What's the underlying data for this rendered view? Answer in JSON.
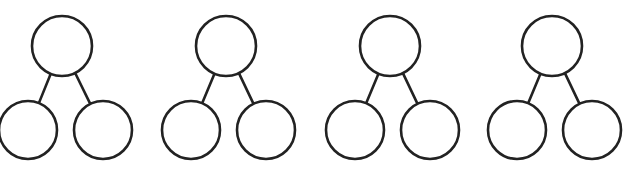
{
  "diagram": {
    "type": "number-bond",
    "stroke_color": "#222222",
    "background": "#ffffff",
    "bonds": [
      {
        "top": {
          "cx": 62,
          "cy": 46,
          "r": 30,
          "label": ""
        },
        "left": {
          "cx": 28,
          "cy": 130,
          "r": 29,
          "label": ""
        },
        "right": {
          "cx": 103,
          "cy": 130,
          "r": 29,
          "label": ""
        }
      },
      {
        "top": {
          "cx": 226,
          "cy": 46,
          "r": 30,
          "label": ""
        },
        "left": {
          "cx": 191,
          "cy": 130,
          "r": 29,
          "label": ""
        },
        "right": {
          "cx": 266,
          "cy": 130,
          "r": 29,
          "label": ""
        }
      },
      {
        "top": {
          "cx": 390,
          "cy": 46,
          "r": 30,
          "label": ""
        },
        "left": {
          "cx": 355,
          "cy": 130,
          "r": 29,
          "label": ""
        },
        "right": {
          "cx": 430,
          "cy": 130,
          "r": 29,
          "label": ""
        }
      },
      {
        "top": {
          "cx": 552,
          "cy": 46,
          "r": 30,
          "label": ""
        },
        "left": {
          "cx": 517,
          "cy": 130,
          "r": 29,
          "label": ""
        },
        "right": {
          "cx": 592,
          "cy": 130,
          "r": 29,
          "label": ""
        }
      }
    ]
  }
}
